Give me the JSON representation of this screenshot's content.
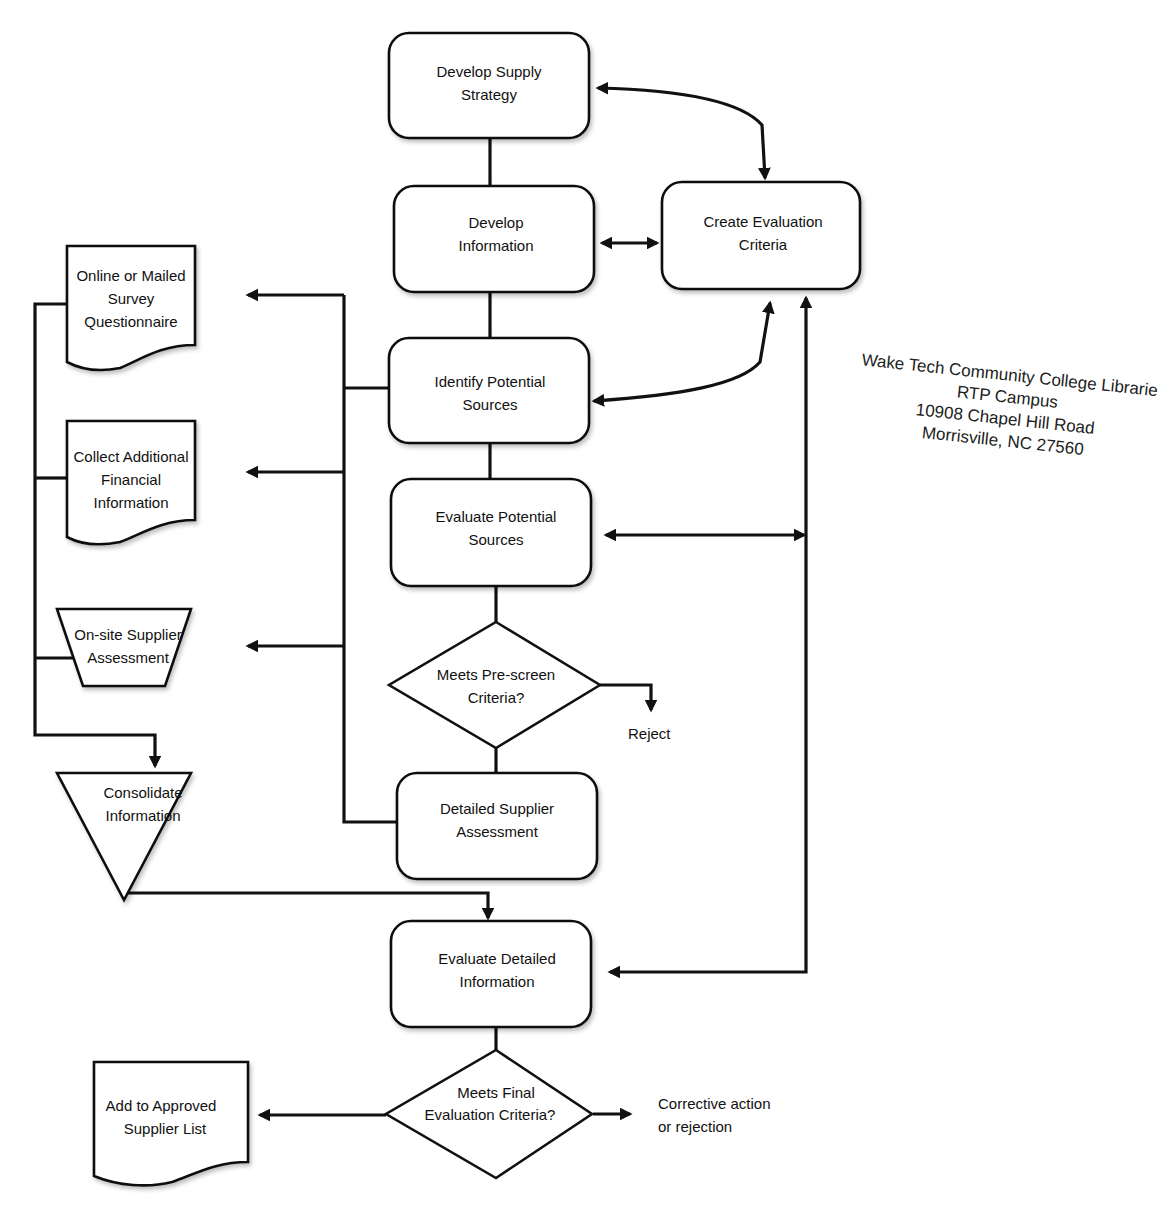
{
  "nodes": {
    "develop_supply_strategy": [
      "Develop Supply",
      "Strategy"
    ],
    "develop_information": [
      "Develop",
      "Information"
    ],
    "create_evaluation_criteria": [
      "Create Evaluation",
      "Criteria"
    ],
    "identify_potential_sources": [
      "Identify Potential",
      "Sources"
    ],
    "evaluate_potential_sources": [
      "Evaluate Potential",
      "Sources"
    ],
    "meets_prescreen_criteria": [
      "Meets Pre-screen",
      "Criteria?"
    ],
    "detailed_supplier_assessment": [
      "Detailed Supplier",
      "Assessment"
    ],
    "evaluate_detailed_information": [
      "Evaluate Detailed",
      "Information"
    ],
    "meets_final_evaluation_criteria": [
      "Meets Final",
      "Evaluation Criteria?"
    ],
    "online_mailed_survey": [
      "Online or Mailed",
      "Survey",
      "Questionnaire"
    ],
    "collect_financial_information": [
      "Collect Additional",
      "Financial",
      "Information"
    ],
    "onsite_supplier_assessment": [
      "On-site Supplier",
      "Assessment"
    ],
    "consolidate_information": [
      "Consolidate",
      "Information"
    ],
    "add_to_approved_list": [
      "Add to Approved",
      "Supplier List"
    ]
  },
  "outcomes": {
    "reject": "Reject",
    "corrective_action": [
      "Corrective action",
      "or rejection"
    ]
  },
  "stamp": {
    "line1": "Wake Tech Community College Librarie",
    "line2": "RTP Campus",
    "line3": "10908 Chapel Hill Road",
    "line4": "Morrisville, NC 27560"
  },
  "colors": {
    "stroke": "#111111",
    "background": "#ffffff"
  }
}
